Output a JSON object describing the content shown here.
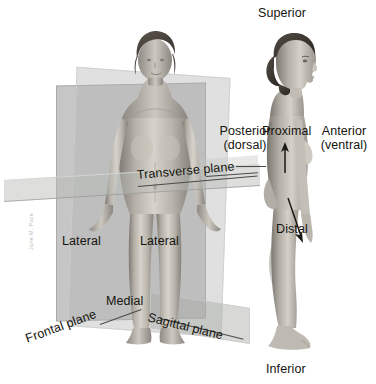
{
  "figure": {
    "background_color": "#ffffff",
    "label_color": "#15140f",
    "plane_color": "#b8bab6"
  },
  "planes": {
    "frontal": {
      "label": "Frontal plane",
      "name": "frontal-plane"
    },
    "sagittal": {
      "label": "Sagittal plane",
      "name": "sagittal-plane"
    },
    "transverse": {
      "label": "Transverse plane",
      "name": "transverse-plane"
    }
  },
  "directional_terms": {
    "superior": "Superior",
    "inferior": "Inferior",
    "posterior": "Posterior",
    "posterior_alt": "(dorsal)",
    "anterior": "Anterior",
    "anterior_alt": "(ventral)",
    "proximal": "Proximal",
    "distal": "Distal",
    "medial": "Medial",
    "lateral_left": "Lateral",
    "lateral_right": "Lateral"
  },
  "figures": {
    "anterior_view": "female-figure-anterior-view",
    "lateral_view": "female-figure-lateral-view"
  },
  "arrows": {
    "proximal_arrow": "up-arrow",
    "distal_arrow": "down-arrow"
  },
  "credit": "Jane M. Pace"
}
